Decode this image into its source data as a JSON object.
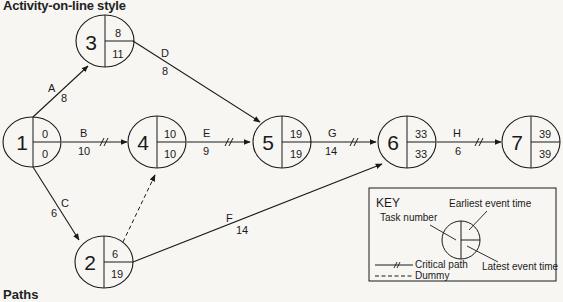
{
  "title": "Activity-on-line style",
  "footer_heading": "Paths",
  "nodes": [
    {
      "id": "1",
      "earliest": "0",
      "latest": "0"
    },
    {
      "id": "2",
      "earliest": "6",
      "latest": "19"
    },
    {
      "id": "3",
      "earliest": "8",
      "latest": "11"
    },
    {
      "id": "4",
      "earliest": "10",
      "latest": "10"
    },
    {
      "id": "5",
      "earliest": "19",
      "latest": "19"
    },
    {
      "id": "6",
      "earliest": "33",
      "latest": "33"
    },
    {
      "id": "7",
      "earliest": "39",
      "latest": "39"
    }
  ],
  "activities": [
    {
      "name": "A",
      "duration": "8",
      "from": "1",
      "to": "3",
      "critical": false
    },
    {
      "name": "B",
      "duration": "10",
      "from": "1",
      "to": "4",
      "critical": true
    },
    {
      "name": "C",
      "duration": "6",
      "from": "1",
      "to": "2",
      "critical": false
    },
    {
      "name": "D",
      "duration": "8",
      "from": "3",
      "to": "5",
      "critical": false
    },
    {
      "name": "E",
      "duration": "9",
      "from": "4",
      "to": "5",
      "critical": true
    },
    {
      "name": "F",
      "duration": "14",
      "from": "2",
      "to": "6",
      "critical": false
    },
    {
      "name": "G",
      "duration": "14",
      "from": "5",
      "to": "6",
      "critical": true
    },
    {
      "name": "H",
      "duration": "6",
      "from": "6",
      "to": "7",
      "critical": true
    }
  ],
  "dummy": {
    "from": "2",
    "to": "4"
  },
  "key": {
    "title": "KEY",
    "task_number": "Task number",
    "earliest_event_time": "Earliest event time",
    "latest_event_time": "Latest event time",
    "critical_path": "Critical path",
    "dummy": "Dummy"
  },
  "colors": {
    "ink": "#1a1a1a",
    "paper": "#f7f6f3"
  }
}
